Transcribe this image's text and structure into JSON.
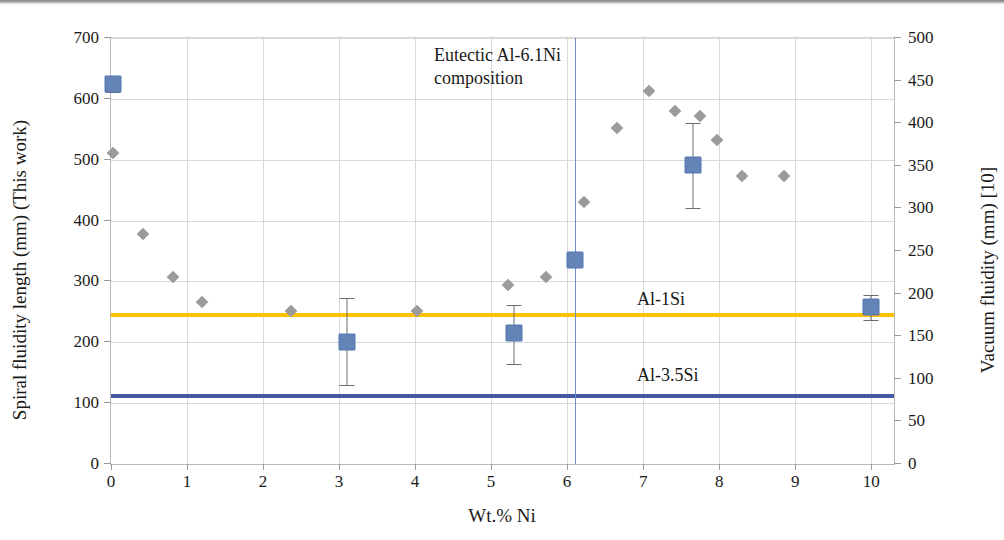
{
  "chart_data": {
    "type": "scatter",
    "title": "",
    "xlabel": "Wt.% Ni",
    "ylabel": "Spiral fluidity length (mm) (This work)",
    "ylabel_right": "Vacuum fluidity (mm) [10]",
    "xlim": [
      0,
      10.3
    ],
    "ylim": [
      0,
      700
    ],
    "ylim_right": [
      0,
      500
    ],
    "xticks": [
      "0",
      "1",
      "2",
      "3",
      "4",
      "5",
      "6",
      "7",
      "8",
      "9",
      "10"
    ],
    "xtick_values": [
      0,
      1,
      2,
      3,
      4,
      5,
      6,
      7,
      8,
      9,
      10
    ],
    "yticks_left": [
      "0",
      "100",
      "200",
      "300",
      "400",
      "500",
      "600",
      "700"
    ],
    "ytick_left_values": [
      0,
      100,
      200,
      300,
      400,
      500,
      600,
      700
    ],
    "yticks_right": [
      "0",
      "50",
      "100",
      "150",
      "200",
      "250",
      "300",
      "350",
      "400",
      "450",
      "500"
    ],
    "ytick_right_values": [
      0,
      50,
      100,
      150,
      200,
      250,
      300,
      350,
      400,
      450,
      500
    ],
    "grid": true,
    "legend": "none",
    "series": [
      {
        "name": "Spiral fluidity length (This work)",
        "marker": "square",
        "color": "#6484b8",
        "axis": "left",
        "points": [
          {
            "x": 0.02,
            "y": 625,
            "yerr_low": 612,
            "yerr_high": 638
          },
          {
            "x": 3.1,
            "y": 200,
            "yerr_low": 130,
            "yerr_high": 272
          },
          {
            "x": 5.3,
            "y": 215,
            "yerr_low": 165,
            "yerr_high": 262
          },
          {
            "x": 6.1,
            "y": 336,
            "yerr_low": 325,
            "yerr_high": 343
          },
          {
            "x": 7.65,
            "y": 492,
            "yerr_low": 420,
            "yerr_high": 560
          },
          {
            "x": 10.0,
            "y": 258,
            "yerr_low": 237,
            "yerr_high": 277
          }
        ]
      },
      {
        "name": "Vacuum fluidity [10]",
        "marker": "diamond",
        "color": "#9b9b9b",
        "axis": "right",
        "points": [
          {
            "x": 0.02,
            "y": 365
          },
          {
            "x": 0.42,
            "y": 270
          },
          {
            "x": 0.82,
            "y": 219
          },
          {
            "x": 1.2,
            "y": 190
          },
          {
            "x": 2.37,
            "y": 180
          },
          {
            "x": 4.03,
            "y": 179
          },
          {
            "x": 5.22,
            "y": 210
          },
          {
            "x": 5.72,
            "y": 219
          },
          {
            "x": 6.22,
            "y": 308
          },
          {
            "x": 6.65,
            "y": 394
          },
          {
            "x": 7.08,
            "y": 438
          },
          {
            "x": 7.42,
            "y": 414
          },
          {
            "x": 7.75,
            "y": 408
          },
          {
            "x": 7.97,
            "y": 380
          },
          {
            "x": 8.3,
            "y": 338
          },
          {
            "x": 8.85,
            "y": 338
          }
        ]
      }
    ],
    "reference_lines": [
      {
        "label": "Al-1Si",
        "value": 248,
        "axis": "left",
        "color": "#ffc000",
        "orientation": "horizontal"
      },
      {
        "label": "Al-3.5Si",
        "value": 115,
        "axis": "left",
        "color": "#4559a5",
        "orientation": "horizontal"
      }
    ],
    "vertical_markers": [
      {
        "label": "Eutectic Al-6.1Ni\ncomposition",
        "value": 6.1,
        "color": "#6f8fc4"
      }
    ],
    "annotations": [
      {
        "name": "eutectic-note",
        "text": "Eutectic Al-6.1Ni\ncomposition"
      },
      {
        "name": "al1si-label",
        "text": "Al-1Si"
      },
      {
        "name": "al35si-label",
        "text": "Al-3.5Si"
      }
    ]
  }
}
